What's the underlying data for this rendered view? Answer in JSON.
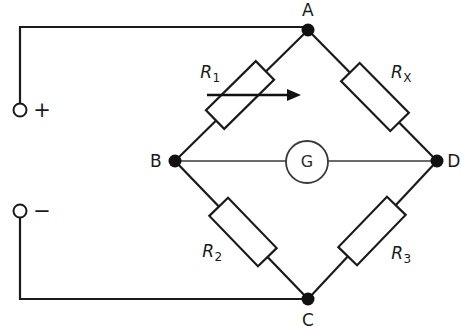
{
  "diagram": {
    "nodes": [
      {
        "id": "A",
        "label": "A",
        "x": 308,
        "y": 30,
        "label_x": 308,
        "label_y": 10
      },
      {
        "id": "B",
        "label": "B",
        "x": 175,
        "y": 161,
        "label_x": 156,
        "label_y": 161
      },
      {
        "id": "C",
        "label": "C",
        "x": 308,
        "y": 299,
        "label_x": 308,
        "label_y": 320
      },
      {
        "id": "D",
        "label": "D",
        "x": 437,
        "y": 161,
        "label_x": 454,
        "label_y": 161
      }
    ],
    "components": [
      {
        "id": "R1",
        "name": "resistor-r1",
        "base": "R",
        "subscript": "1",
        "type": "variable-resistor",
        "branch": "B-A",
        "label_x": 210,
        "label_y": 72
      },
      {
        "id": "RX",
        "name": "resistor-rx",
        "base": "R",
        "subscript": "X",
        "type": "resistor",
        "branch": "A-D",
        "label_x": 401,
        "label_y": 72
      },
      {
        "id": "R2",
        "name": "resistor-r2",
        "base": "R",
        "subscript": "2",
        "type": "resistor",
        "branch": "B-C",
        "label_x": 212,
        "label_y": 251
      },
      {
        "id": "R3",
        "name": "resistor-r3",
        "base": "R",
        "subscript": "3",
        "type": "resistor",
        "branch": "C-D",
        "label_x": 401,
        "label_y": 253
      }
    ],
    "meter": {
      "id": "G",
      "label": "G",
      "type": "galvanometer",
      "cx": 307,
      "cy": 162,
      "r": 21
    },
    "terminals": [
      {
        "id": "positive",
        "sign": "+",
        "polarity": "positive",
        "cx": 20,
        "cy": 110,
        "r": 6.5,
        "sign_x": 42,
        "sign_y": 110
      },
      {
        "id": "negative",
        "sign": "−",
        "polarity": "negative",
        "cx": 20,
        "cy": 211,
        "r": 6.5,
        "sign_x": 42,
        "sign_y": 211
      }
    ],
    "colors": {
      "line": "#1a1a1a",
      "background": "#ffffff",
      "meter_line": "#3a3a3a"
    }
  }
}
